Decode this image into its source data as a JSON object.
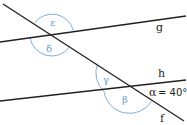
{
  "diagram": {
    "type": "angles-at-transversal",
    "lines": [
      {
        "id": "g",
        "label": "g"
      },
      {
        "id": "h",
        "label": "h"
      },
      {
        "id": "f",
        "label": "f"
      }
    ],
    "angles": {
      "epsilon": "ε",
      "delta": "δ",
      "gamma": "γ",
      "beta": "β",
      "alpha": "α",
      "alpha_value": "= 40°"
    },
    "colors": {
      "line": "#231f20",
      "arc": "#5b9bd5"
    }
  }
}
